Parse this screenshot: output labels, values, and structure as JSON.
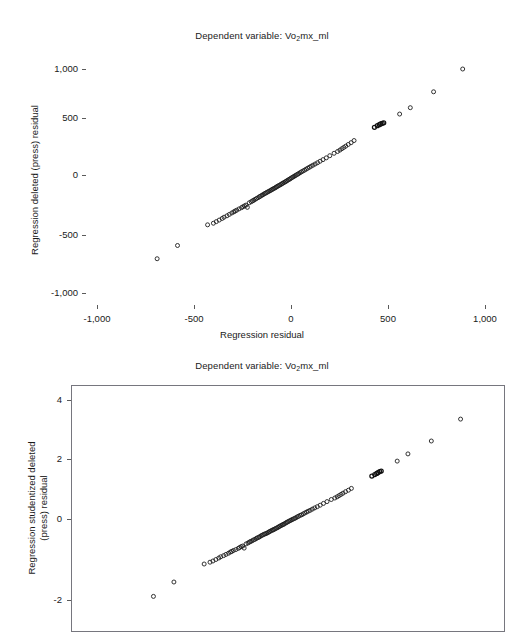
{
  "figures": [
    {
      "id": "top",
      "title": {
        "prefix": "Dependent variable: Vo",
        "sub": "2",
        "suffix": "mx_ml"
      },
      "xlabel": "Regression residual",
      "ylabel": "Regression deleted (press) residual",
      "xticks": [
        "-1,000",
        "-500",
        "0",
        "500",
        "1,000"
      ],
      "yticks": [
        "1,000",
        "500",
        "0",
        "-500",
        "-1,000"
      ],
      "frame": false
    },
    {
      "id": "bottom",
      "title": {
        "prefix": "Dependent variable: Vo",
        "sub": "2",
        "suffix": "mx_ml"
      },
      "xlabel": "",
      "ylabel_line1": "Regression studentized deleted",
      "ylabel_line2": "(press) residual",
      "xticks": [],
      "yticks": [
        "4",
        "2",
        "0",
        "-2"
      ],
      "frame": true
    }
  ],
  "chart_data": [
    {
      "type": "scatter",
      "title": "Dependent variable: Vo2mx_ml",
      "xlabel": "Regression residual",
      "ylabel": "Regression deleted (press) residual",
      "xlim": [
        -1250,
        1250
      ],
      "ylim": [
        -1180,
        1180
      ],
      "xticks": [
        -1000,
        -500,
        0,
        500,
        1000
      ],
      "yticks": [
        -1000,
        -500,
        0,
        500,
        1000
      ],
      "grid": false,
      "legend": "none",
      "marker": "open-circle",
      "marker_color": "#1d1d1d",
      "x": [
        -690,
        -585,
        -430,
        -400,
        -385,
        -370,
        -355,
        -345,
        -330,
        -318,
        -305,
        -295,
        -288,
        -280,
        -268,
        -255,
        -248,
        -240,
        -232,
        -225,
        -215,
        -205,
        -198,
        -192,
        -185,
        -178,
        -170,
        -163,
        -158,
        -150,
        -145,
        -138,
        -132,
        -126,
        -120,
        -114,
        -108,
        -102,
        -97,
        -92,
        -86,
        -80,
        -75,
        -70,
        -64,
        -58,
        -52,
        -47,
        -42,
        -36,
        -30,
        -25,
        -20,
        -14,
        -8,
        -3,
        3,
        9,
        15,
        21,
        27,
        34,
        40,
        47,
        54,
        62,
        70,
        78,
        86,
        95,
        104,
        114,
        125,
        137,
        150,
        165,
        182,
        200,
        222,
        240,
        252,
        262,
        272,
        282,
        295,
        310,
        325,
        430,
        445,
        455,
        462,
        470,
        478,
        560,
        615,
        735,
        885
      ],
      "y": [
        -790,
        -665,
        -470,
        -455,
        -440,
        -425,
        -410,
        -398,
        -385,
        -372,
        -358,
        -348,
        -340,
        -332,
        -320,
        -308,
        -300,
        -292,
        -284,
        -305,
        -262,
        -252,
        -244,
        -238,
        -230,
        -222,
        -214,
        -206,
        -200,
        -192,
        -186,
        -178,
        -172,
        -166,
        -160,
        -154,
        -148,
        -142,
        -136,
        -131,
        -125,
        -119,
        -113,
        -107,
        -101,
        -95,
        -89,
        -83,
        -77,
        -71,
        -65,
        -59,
        -53,
        -46,
        -40,
        -34,
        -27,
        -20,
        -14,
        -7,
        0,
        7,
        14,
        22,
        30,
        38,
        46,
        55,
        64,
        73,
        83,
        93,
        104,
        116,
        130,
        145,
        162,
        182,
        205,
        222,
        235,
        248,
        260,
        272,
        288,
        305,
        325,
        450,
        465,
        475,
        482,
        488,
        492,
        575,
        635,
        785,
        1000
      ]
    },
    {
      "type": "scatter",
      "title": "Dependent variable: Vo2mx_ml",
      "xlabel": "",
      "ylabel": "Regression studentized deleted (press) residual",
      "ylim": [
        -3.0,
        4.6
      ],
      "yticks": [
        -2,
        0,
        2,
        4
      ],
      "grid": false,
      "legend": "none",
      "marker": "open-circle",
      "marker_color": "#1d1d1d",
      "x": [
        -690,
        -585,
        -430,
        -400,
        -385,
        -370,
        -355,
        -345,
        -330,
        -318,
        -305,
        -295,
        -288,
        -280,
        -268,
        -255,
        -248,
        -240,
        -232,
        -225,
        -215,
        -205,
        -198,
        -192,
        -185,
        -178,
        -170,
        -163,
        -158,
        -150,
        -145,
        -138,
        -132,
        -126,
        -120,
        -114,
        -108,
        -102,
        -97,
        -92,
        -86,
        -80,
        -75,
        -70,
        -64,
        -58,
        -52,
        -47,
        -42,
        -36,
        -30,
        -25,
        -20,
        -14,
        -8,
        -3,
        3,
        9,
        15,
        21,
        27,
        34,
        40,
        47,
        54,
        62,
        70,
        78,
        86,
        95,
        104,
        114,
        125,
        137,
        150,
        165,
        182,
        200,
        222,
        240,
        252,
        262,
        272,
        282,
        295,
        310,
        325,
        430,
        445,
        455,
        462,
        470,
        478,
        560,
        615,
        735,
        885
      ],
      "y": [
        -2.58,
        -2.1,
        -1.5,
        -1.44,
        -1.4,
        -1.35,
        -1.3,
        -1.26,
        -1.22,
        -1.18,
        -1.14,
        -1.1,
        -1.08,
        -1.05,
        -1.02,
        -0.98,
        -0.95,
        -0.92,
        -0.9,
        -0.97,
        -0.83,
        -0.8,
        -0.77,
        -0.75,
        -0.73,
        -0.7,
        -0.68,
        -0.65,
        -0.63,
        -0.61,
        -0.59,
        -0.56,
        -0.54,
        -0.52,
        -0.5,
        -0.49,
        -0.47,
        -0.45,
        -0.43,
        -0.41,
        -0.39,
        -0.37,
        -0.36,
        -0.34,
        -0.32,
        -0.3,
        -0.28,
        -0.26,
        -0.24,
        -0.22,
        -0.2,
        -0.18,
        -0.17,
        -0.14,
        -0.12,
        -0.1,
        -0.08,
        -0.06,
        -0.04,
        -0.02,
        0.0,
        0.02,
        0.04,
        0.07,
        0.09,
        0.12,
        0.14,
        0.17,
        0.2,
        0.23,
        0.26,
        0.29,
        0.33,
        0.37,
        0.41,
        0.46,
        0.52,
        0.58,
        0.65,
        0.7,
        0.74,
        0.78,
        0.82,
        0.86,
        0.91,
        0.96,
        1.02,
        1.43,
        1.48,
        1.52,
        1.55,
        1.58,
        1.6,
        1.93,
        2.17,
        2.6,
        3.33
      ]
    }
  ]
}
